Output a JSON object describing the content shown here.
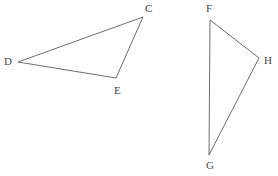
{
  "figure": {
    "background_color": "#ffffff",
    "stroke_color": "#6e6e6e",
    "label_color": "#454545",
    "stroke_width": 1,
    "width": 278,
    "height": 176,
    "shapes": [
      {
        "name": "triangle-cde",
        "label": "Triangle CDE",
        "closed": true,
        "points": "143,17 18,62 116,78",
        "vertices": [
          {
            "id": "C",
            "label": "C",
            "x": 143,
            "y": 17,
            "label_x": 145,
            "label_y": 3
          },
          {
            "id": "D",
            "label": "D",
            "x": 18,
            "y": 62,
            "label_x": 4,
            "label_y": 56
          },
          {
            "id": "E",
            "label": "E",
            "x": 116,
            "y": 78,
            "label_x": 114,
            "label_y": 85
          }
        ]
      },
      {
        "name": "triangle-fgh",
        "label": "Triangle FGH",
        "closed": true,
        "points": "210,20 259,58 209,155",
        "vertices": [
          {
            "id": "F",
            "label": "F",
            "x": 210,
            "y": 20,
            "label_x": 206,
            "label_y": 3
          },
          {
            "id": "H",
            "label": "H",
            "x": 259,
            "y": 58,
            "label_x": 264,
            "label_y": 55
          },
          {
            "id": "G",
            "label": "G",
            "x": 209,
            "y": 155,
            "label_x": 206,
            "label_y": 160
          }
        ]
      }
    ]
  }
}
